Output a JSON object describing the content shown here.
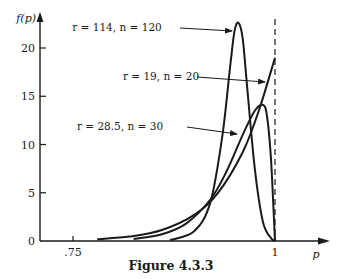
{
  "chart_data": {
    "type": "line",
    "title": "Figure 4.3.3",
    "xlabel": "p",
    "ylabel": "f(p)",
    "xlim": [
      0.71,
      1.08
    ],
    "ylim": [
      0,
      23.5
    ],
    "x_ticks": [
      {
        "value": 0.75,
        "label": ".75"
      },
      {
        "value": 1,
        "label": "1"
      }
    ],
    "y_ticks": [
      {
        "value": 0,
        "label": "0"
      },
      {
        "value": 5,
        "label": "5"
      },
      {
        "value": 10,
        "label": "10"
      },
      {
        "value": 15,
        "label": "15"
      },
      {
        "value": 20,
        "label": "20"
      }
    ],
    "reference_line": {
      "type": "vertical-dashed",
      "x": 1
    },
    "grid": false,
    "legend": "annotations with arrows",
    "series": [
      {
        "name": "r = 114, n = 120",
        "x": [
          0.87,
          0.9,
          0.92,
          0.935,
          0.945,
          0.95,
          0.955,
          0.96,
          0.965,
          0.975,
          0.985,
          0.995,
          1.0
        ],
        "y": [
          0.1,
          1.0,
          4.0,
          11.0,
          18.5,
          21.8,
          22.6,
          21.0,
          16.5,
          7.5,
          2.0,
          0.3,
          0.0
        ]
      },
      {
        "name": "r = 19, n = 20",
        "x": [
          0.78,
          0.82,
          0.86,
          0.9,
          0.93,
          0.96,
          0.98,
          1.0
        ],
        "y": [
          0.18,
          0.46,
          1.14,
          2.7,
          5.05,
          9.2,
          13.5,
          19.0
        ]
      },
      {
        "name": "r = 28.5, n = 30",
        "x": [
          0.825,
          0.86,
          0.89,
          0.92,
          0.94,
          0.96,
          0.975,
          0.985,
          0.99,
          0.995,
          1.0
        ],
        "y": [
          0.2,
          0.7,
          1.8,
          4.3,
          7.2,
          11.0,
          13.5,
          14.1,
          13.0,
          8.5,
          0.0
        ]
      }
    ]
  },
  "annotations": [
    {
      "label": "r = 114, n = 120",
      "target_series": 0
    },
    {
      "label": "r = 19, n = 20",
      "target_series": 1
    },
    {
      "label": "r = 28.5, n = 30",
      "target_series": 2
    }
  ],
  "caption": "Figure 4.3.3"
}
